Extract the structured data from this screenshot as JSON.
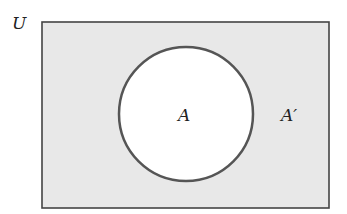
{
  "diagram": {
    "type": "venn",
    "universe": {
      "label": "U",
      "fill": "#e8e8e8",
      "stroke": "#444444"
    },
    "set": {
      "label": "A",
      "fill": "#ffffff",
      "stroke": "#555555"
    },
    "complement": {
      "label": "A′"
    }
  }
}
